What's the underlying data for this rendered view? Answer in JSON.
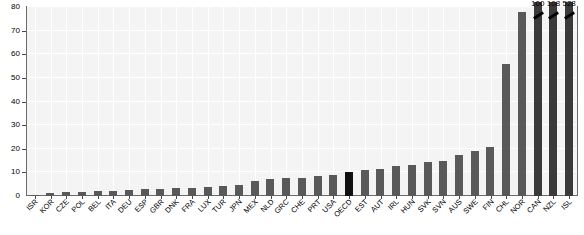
{
  "chart_data": {
    "type": "bar",
    "title": "",
    "xlabel": "",
    "ylabel": "",
    "ylim": [
      0,
      80
    ],
    "yticks": [
      0,
      10,
      20,
      30,
      40,
      50,
      60,
      70,
      80
    ],
    "grid": true,
    "legend": null,
    "categories": [
      "ISR",
      "KOR",
      "CZE",
      "POL",
      "BEL",
      "ITA",
      "DEU",
      "ESP",
      "GBR",
      "DNK",
      "FRA",
      "LUX",
      "TUR",
      "JPN",
      "MEX",
      "NLD",
      "GRC",
      "CHE",
      "PRT",
      "USA",
      "OECD",
      "EST",
      "AUT",
      "IRL",
      "HUN",
      "SVK",
      "SVN",
      "AUS",
      "SWE",
      "FIN",
      "CHL",
      "NOR",
      "CAN",
      "NZL",
      "ISL"
    ],
    "values": [
      0.4,
      1.1,
      1.6,
      1.9,
      2.1,
      2.3,
      2.6,
      2.8,
      3.0,
      3.2,
      3.6,
      3.8,
      4.1,
      4.6,
      6.2,
      7.4,
      7.5,
      7.8,
      8.3,
      9.0,
      10.2,
      11.1,
      11.6,
      12.6,
      13.0,
      14.6,
      15.0,
      17.5,
      19.1,
      20.6,
      56.0,
      78.0,
      100.0,
      108.0,
      528.0
    ],
    "highlight_category": "OECD",
    "highlight_color": "#111111",
    "bar_color": "#595959",
    "clipped_categories": [
      "CAN",
      "NZL",
      "ISL"
    ],
    "clipped_labels": [
      "100",
      "108",
      "528"
    ],
    "axis_break": true,
    "ytick_labels": [
      "0",
      "10",
      "20",
      "30",
      "40",
      "50",
      "60",
      "70",
      "80"
    ]
  }
}
